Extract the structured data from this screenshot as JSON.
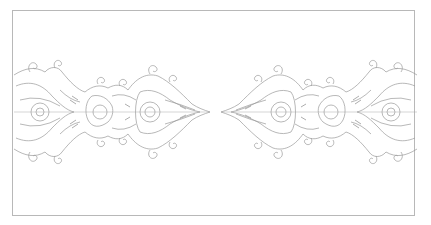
{
  "image": {
    "description": "Symmetrical ornamental filigree line-art band inside a thin gray rectangular frame, two mirrored halves with pointed tips meeting at the center",
    "colors": {
      "background": "#ffffff",
      "frame": "#b8b8b8",
      "line": "#9a9a9a",
      "line_dark": "#7a7a7a"
    }
  }
}
